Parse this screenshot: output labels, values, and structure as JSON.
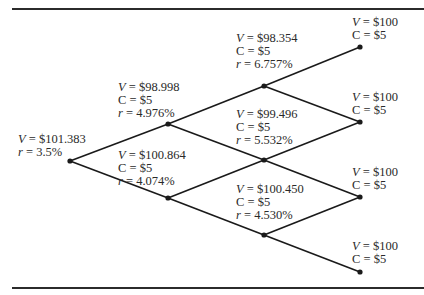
{
  "figure": {
    "type": "binomial interest rate tree",
    "nodes": [
      {
        "id": "n0",
        "x": 70,
        "y": 161,
        "lines": [
          "V = $101.383",
          "r = 3.5%"
        ],
        "label_x": 18,
        "label_y": 133
      },
      {
        "id": "n1u",
        "x": 168,
        "y": 124,
        "lines": [
          "V = $98.998",
          "C = $5",
          "r = 4.976%"
        ],
        "label_x": 118,
        "label_y": 81
      },
      {
        "id": "n1d",
        "x": 168,
        "y": 198,
        "lines": [
          "V = $100.864",
          "C = $5",
          "r = 4.074%"
        ],
        "label_x": 118,
        "label_y": 149
      },
      {
        "id": "n2uu",
        "x": 264,
        "y": 86,
        "lines": [
          "V = $98.354",
          "C = $5",
          "r = 6.757%"
        ],
        "label_x": 236,
        "label_y": 32
      },
      {
        "id": "n2ud",
        "x": 264,
        "y": 160,
        "lines": [
          "V = $99.496",
          "C = $5",
          "r = 5.532%"
        ],
        "label_x": 236,
        "label_y": 108
      },
      {
        "id": "n2dd",
        "x": 264,
        "y": 235,
        "lines": [
          "V = $100.450",
          "C = $5",
          "r = 4.530%"
        ],
        "label_x": 236,
        "label_y": 183
      },
      {
        "id": "n3a",
        "x": 360,
        "y": 47,
        "lines": [
          "V = $100",
          "C = $5"
        ],
        "label_x": 352,
        "label_y": 16
      },
      {
        "id": "n3b",
        "x": 360,
        "y": 122,
        "lines": [
          "V = $100",
          "C = $5"
        ],
        "label_x": 352,
        "label_y": 91
      },
      {
        "id": "n3c",
        "x": 360,
        "y": 197,
        "lines": [
          "V = $100",
          "C = $5"
        ],
        "label_x": 352,
        "label_y": 166
      },
      {
        "id": "n3d",
        "x": 360,
        "y": 272,
        "lines": [
          "V = $100",
          "C = $5"
        ],
        "label_x": 352,
        "label_y": 240
      }
    ],
    "edges": [
      [
        "n0",
        "n1u"
      ],
      [
        "n0",
        "n1d"
      ],
      [
        "n1u",
        "n2uu"
      ],
      [
        "n1u",
        "n2ud"
      ],
      [
        "n1d",
        "n2ud"
      ],
      [
        "n1d",
        "n2dd"
      ],
      [
        "n2uu",
        "n3a"
      ],
      [
        "n2uu",
        "n3b"
      ],
      [
        "n2ud",
        "n3b"
      ],
      [
        "n2ud",
        "n3c"
      ],
      [
        "n2dd",
        "n3c"
      ],
      [
        "n2dd",
        "n3d"
      ]
    ],
    "colors": {
      "line": "#1a1a1a",
      "text": "#2a2a2a",
      "rule": "#2b2b2b"
    }
  }
}
